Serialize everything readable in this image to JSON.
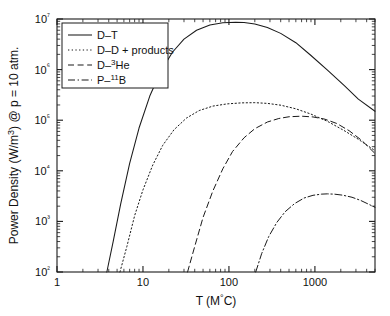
{
  "chart_data": {
    "type": "line",
    "title": "",
    "xlabel": "T (M°C)",
    "ylabel": "Power Density (W/m³) @ p = 10 atm.",
    "xscale": "log",
    "yscale": "log",
    "xlim": [
      1,
      5000
    ],
    "ylim": [
      100,
      10000000
    ],
    "xticks": [
      1,
      10,
      100,
      1000
    ],
    "xticklabels": [
      "1",
      "10",
      "100",
      "1000"
    ],
    "yticks": [
      100,
      1000,
      10000,
      100000,
      1000000,
      10000000
    ],
    "yticklabels": [
      "10²",
      "10³",
      "10⁴",
      "10⁵",
      "10⁶",
      "10⁷"
    ],
    "grid": false,
    "legend_position": "upper-left",
    "series": [
      {
        "name": "D–T",
        "style": "solid",
        "peak_x": 150,
        "peak_y": 8500000,
        "x": [
          3.8,
          4.5,
          5.5,
          7,
          9,
          12,
          16,
          22,
          30,
          42,
          60,
          85,
          120,
          150,
          200,
          280,
          400,
          600,
          900,
          1400,
          2200,
          3200,
          5000
        ],
        "y": [
          100,
          400,
          2200,
          14000,
          70000,
          300000,
          900000,
          2200000,
          4000000,
          6000000,
          7600000,
          8400000,
          8600000,
          8500000,
          8000000,
          6800000,
          5200000,
          3400000,
          1900000,
          980000,
          480000,
          260000,
          150000
        ]
      },
      {
        "name": "D–D + products",
        "style": "dotted",
        "peak_x": 200,
        "peak_y": 220000,
        "x": [
          5.4,
          6.5,
          8,
          10,
          13,
          17,
          23,
          32,
          45,
          65,
          95,
          140,
          200,
          280,
          400,
          600,
          900,
          1400,
          2200,
          3200,
          5000
        ],
        "y": [
          100,
          320,
          1300,
          4200,
          13000,
          32000,
          65000,
          110000,
          155000,
          190000,
          210000,
          220000,
          222000,
          215000,
          198000,
          168000,
          132000,
          95000,
          62000,
          42000,
          25000
        ]
      },
      {
        "name": "D–³He",
        "style": "dashed",
        "peak_x": 700,
        "peak_y": 120000,
        "x": [
          33,
          40,
          50,
          65,
          85,
          110,
          150,
          200,
          280,
          380,
          500,
          700,
          950,
          1300,
          1800,
          2500,
          3500,
          5000
        ],
        "y": [
          100,
          320,
          1200,
          4000,
          11000,
          24000,
          45000,
          68000,
          92000,
          108000,
          117000,
          120000,
          116000,
          105000,
          86000,
          62000,
          40000,
          22000
        ]
      },
      {
        "name": "P–¹¹B",
        "style": "dashdot",
        "peak_x": 1400,
        "peak_y": 3500,
        "x": [
          205,
          240,
          290,
          360,
          450,
          580,
          750,
          950,
          1200,
          1400,
          1700,
          2100,
          2700,
          3400,
          5000
        ],
        "y": [
          100,
          230,
          500,
          950,
          1550,
          2250,
          2900,
          3280,
          3460,
          3500,
          3450,
          3300,
          3000,
          2600,
          1900
        ]
      }
    ]
  },
  "legend": {
    "items": [
      {
        "label": "D–T"
      },
      {
        "label": "D–D + products"
      },
      {
        "label": "D–³He"
      },
      {
        "label": "P–¹¹B"
      }
    ]
  }
}
